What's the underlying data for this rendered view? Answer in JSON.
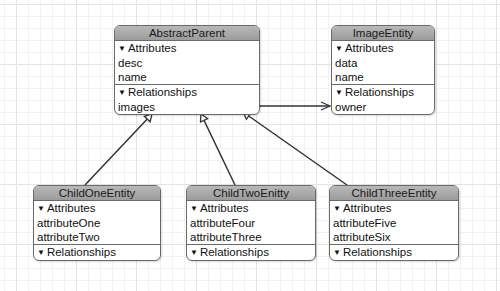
{
  "entities": {
    "abstract_parent": {
      "name": "AbstractParent",
      "attributes_label": "Attributes",
      "attributes": [
        "desc",
        "name"
      ],
      "relationships_label": "Relationships",
      "relationships": [
        "images"
      ]
    },
    "image_entity": {
      "name": "ImageEntity",
      "attributes_label": "Attributes",
      "attributes": [
        "data",
        "name"
      ],
      "relationships_label": "Relationships",
      "relationships": [
        "owner"
      ]
    },
    "child_one": {
      "name": "ChildOneEntity",
      "attributes_label": "Attributes",
      "attributes": [
        "attributeOne",
        "attributeTwo"
      ],
      "relationships_label": "Relationships"
    },
    "child_two": {
      "name": "ChildTwoEnitty",
      "attributes_label": "Attributes",
      "attributes": [
        "attributeFour",
        "attributeThree"
      ],
      "relationships_label": "Relationships"
    },
    "child_three": {
      "name": "ChildThreeEntity",
      "attributes_label": "Attributes",
      "attributes": [
        "attributeFive",
        "attributeSix"
      ],
      "relationships_label": "Relationships"
    }
  },
  "icons": {
    "disclosure": "▼"
  }
}
